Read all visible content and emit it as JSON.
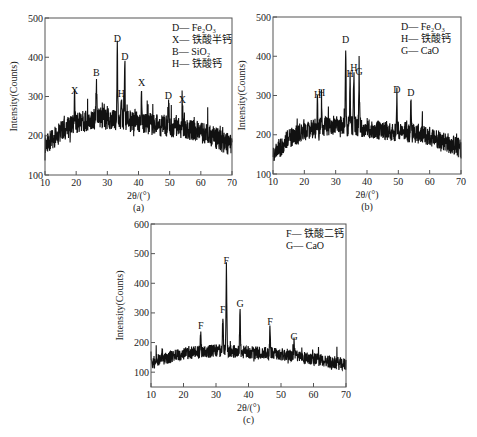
{
  "figure": {
    "background": "#ffffff",
    "trace_color": "#111111",
    "axis_color": "#555555"
  },
  "chart_data": [
    {
      "id": "a",
      "type": "line",
      "panel_label": "(a)",
      "title": "",
      "xlabel": "2θ/(°)",
      "ylabel": "Intensity(Counts)",
      "xlim": [
        10,
        70
      ],
      "ylim": [
        100,
        500
      ],
      "xticks": [
        10,
        20,
        30,
        40,
        50,
        60,
        70
      ],
      "yticks": [
        100,
        200,
        300,
        400,
        500
      ],
      "grid": false,
      "legend_position": "top-right",
      "legend": [
        {
          "symbol": "D",
          "phase": "Fe₂O₃"
        },
        {
          "symbol": "X",
          "phase": "铁酸半钙"
        },
        {
          "symbol": "B",
          "phase": "SiO₂"
        },
        {
          "symbol": "H",
          "phase": "铁酸钙"
        }
      ],
      "baseline": {
        "x": [
          10,
          15,
          20,
          27,
          35,
          45,
          55,
          62,
          70
        ],
        "y": [
          175,
          210,
          232,
          245,
          240,
          228,
          218,
          205,
          175
        ],
        "noise": 28
      },
      "peaks": [
        {
          "label": "X",
          "x": 19.5,
          "y": 300
        },
        {
          "label": "B",
          "x": 26.5,
          "y": 345
        },
        {
          "label": "D",
          "x": 33.2,
          "y": 430
        },
        {
          "label": "H",
          "x": 34.5,
          "y": 290
        },
        {
          "label": "D",
          "x": 35.6,
          "y": 385
        },
        {
          "label": "X",
          "x": 41.0,
          "y": 320
        },
        {
          "label": "D",
          "x": 49.6,
          "y": 285
        },
        {
          "label": "X",
          "x": 54.1,
          "y": 275
        }
      ],
      "box": {
        "left": 45,
        "top": 18,
        "right": 232,
        "bottom": 175
      }
    },
    {
      "id": "b",
      "type": "line",
      "panel_label": "(b)",
      "title": "",
      "xlabel": "2θ/(°)",
      "ylabel": "Intensity(Counts)",
      "xlim": [
        10,
        70
      ],
      "ylim": [
        100,
        500
      ],
      "xticks": [
        10,
        20,
        30,
        40,
        50,
        60,
        70
      ],
      "yticks": [
        100,
        200,
        300,
        400,
        500
      ],
      "grid": false,
      "legend_position": "top-right",
      "legend": [
        {
          "symbol": "D",
          "phase": "Fe₂O₃"
        },
        {
          "symbol": "H",
          "phase": "铁酸钙"
        },
        {
          "symbol": "G",
          "phase": "CaO"
        }
      ],
      "baseline": {
        "x": [
          10,
          15,
          20,
          28,
          35,
          45,
          55,
          63,
          70
        ],
        "y": [
          150,
          190,
          210,
          222,
          222,
          212,
          205,
          190,
          165
        ],
        "noise": 26
      },
      "peaks": [
        {
          "label": "H",
          "x": 24.2,
          "y": 285
        },
        {
          "label": "H",
          "x": 25.5,
          "y": 292
        },
        {
          "label": "D",
          "x": 33.2,
          "y": 425
        },
        {
          "label": "H",
          "x": 34.6,
          "y": 340
        },
        {
          "label": "H",
          "x": 35.8,
          "y": 355
        },
        {
          "label": "G",
          "x": 37.5,
          "y": 345
        },
        {
          "label": "D",
          "x": 49.5,
          "y": 300
        },
        {
          "label": "D",
          "x": 54.0,
          "y": 290
        }
      ],
      "box": {
        "left": 273,
        "top": 17,
        "right": 461,
        "bottom": 174
      }
    },
    {
      "id": "c",
      "type": "line",
      "panel_label": "(c)",
      "title": "",
      "xlabel": "2θ/(°)",
      "ylabel": "Intensity(Counts)",
      "xlim": [
        10,
        70
      ],
      "ylim": [
        50,
        600
      ],
      "xticks": [
        10,
        20,
        30,
        40,
        50,
        60,
        70
      ],
      "yticks": [
        100,
        200,
        300,
        400,
        500,
        600
      ],
      "grid": false,
      "legend_position": "top-right",
      "legend": [
        {
          "symbol": "F",
          "phase": "铁酸二钙"
        },
        {
          "symbol": "G",
          "phase": "CaO"
        }
      ],
      "baseline": {
        "x": [
          10,
          15,
          22,
          30,
          38,
          50,
          60,
          70
        ],
        "y": [
          130,
          150,
          165,
          172,
          168,
          160,
          145,
          125
        ],
        "noise": 22
      },
      "peaks": [
        {
          "label": "F",
          "x": 25.3,
          "y": 235
        },
        {
          "label": "F",
          "x": 32.1,
          "y": 290
        },
        {
          "label": "F",
          "x": 33.2,
          "y": 455
        },
        {
          "label": "G",
          "x": 37.4,
          "y": 310
        },
        {
          "label": "F",
          "x": 46.6,
          "y": 250
        },
        {
          "label": "G",
          "x": 54.0,
          "y": 200
        }
      ],
      "box": {
        "left": 151,
        "top": 224,
        "right": 346,
        "bottom": 387
      }
    }
  ]
}
